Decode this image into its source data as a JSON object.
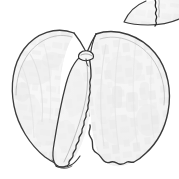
{
  "figure": {
    "title": "Botanical line drawing of a split seed showing two cotyledon lobes",
    "subject": "seed",
    "technique": "pen-and-ink stipple line drawing",
    "background_color": "#ffffff",
    "outline_color": "#3a3a3a",
    "fill_color": "#f4f4f4",
    "shading_color": "#e2e2e2",
    "canvas": {
      "width": 179,
      "height": 179
    },
    "labels": [],
    "scale_bar": null,
    "caption": ""
  },
  "specimens": [
    {
      "id": "main-seed",
      "name": "main-seed-specimen",
      "description": "Whole seed split open into a left lobe, a narrow central lobe, and a large right lobe",
      "bounds": {
        "x": 10,
        "y": 26,
        "width": 162,
        "height": 142
      },
      "parts": [
        {
          "id": "left-lobe",
          "name": "left-cotyledon-lobe",
          "outline_color": "#3c3c3c",
          "fill_color": "#f3f3f3"
        },
        {
          "id": "inner-lobe",
          "name": "inner-cotyledon-lobe",
          "edge_style": "serrated",
          "outline_color": "#333333",
          "fill_color": "#f6f6f6"
        },
        {
          "id": "right-lobe",
          "name": "right-cotyledon-lobe",
          "edge_style": "scalloped",
          "outline_color": "#3a3a3a",
          "fill_color": "#f2f2f2"
        },
        {
          "id": "hilum-notch",
          "name": "hilum-notch",
          "outline_color": "#2e2e2e"
        }
      ]
    },
    {
      "id": "top-partial-seed",
      "name": "cropped-seed-specimen",
      "description": "Partially visible second seed cropped by the top-right edge of the frame",
      "bounds": {
        "x": 118,
        "y": 0,
        "width": 61,
        "height": 22
      },
      "parts": [
        {
          "id": "partial-body",
          "name": "partial-seed-body",
          "outline_color": "#3a3a3a",
          "fill_color": "#f1f1f1"
        },
        {
          "id": "partial-suture",
          "name": "partial-seed-suture-line",
          "outline_color": "#2b2b2b"
        }
      ]
    }
  ]
}
